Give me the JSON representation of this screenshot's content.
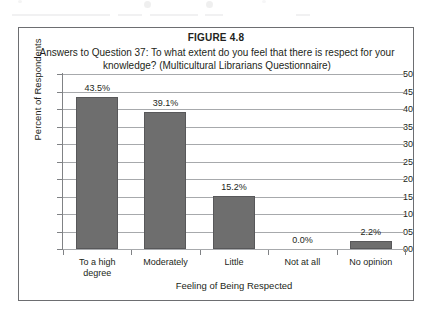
{
  "figure": {
    "number": "FIGURE 4.8",
    "caption": "Answers to Question 37: To what extent do you feel that there is respect for your knowledge? (Multicultural Librarians Questionnaire)"
  },
  "chart_data": {
    "type": "bar",
    "title": "Answers to Question 37: To what extent do you feel that there is respect for your knowledge? (Multicultural Librarians Questionnaire)",
    "xlabel": "Feeling of Being Respected",
    "ylabel": "Percent of Respondents",
    "categories": [
      "To a high degree",
      "Moderately",
      "Little",
      "Not at all",
      "No opinion"
    ],
    "category_lines": [
      [
        "To a high",
        "degree"
      ],
      [
        "Moderately"
      ],
      [
        "Little"
      ],
      [
        "Not at all"
      ],
      [
        "No opinion"
      ]
    ],
    "values": [
      43.5,
      39.1,
      15.2,
      0.0,
      2.2
    ],
    "data_labels": [
      "43.5%",
      "39.1%",
      "15.2%",
      "0.0%",
      "2.2%"
    ],
    "ylim": [
      0,
      50
    ],
    "ytick_values": [
      0,
      5,
      10,
      15,
      20,
      25,
      30,
      35,
      40,
      45,
      50
    ],
    "ytick_labels": [
      "00",
      "05",
      "10",
      "15",
      "20",
      "25",
      "30",
      "35",
      "40",
      "45",
      "50"
    ],
    "grid": true,
    "legend": null,
    "bar_color": "#6e6e6e",
    "gridline_color": "#a7a9ac",
    "axis_color": "#808285",
    "background": "#ffffff"
  }
}
